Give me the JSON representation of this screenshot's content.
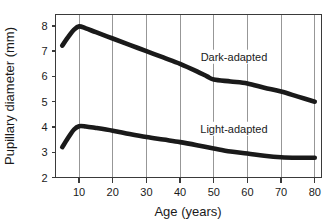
{
  "chart_data": {
    "type": "line",
    "title": "",
    "xlabel": "Age  (years)",
    "ylabel": "Pupillary diameter (mm)",
    "xlim": [
      3,
      82
    ],
    "ylim": [
      2,
      8.45
    ],
    "xticks": [
      10,
      20,
      30,
      40,
      50,
      60,
      70,
      80
    ],
    "yticks": [
      2,
      3,
      4,
      5,
      6,
      7,
      8
    ],
    "xtick_labels": [
      "10",
      "20",
      "30",
      "40",
      "50",
      "60",
      "70",
      "80"
    ],
    "ytick_labels": [
      "2",
      "3",
      "4",
      "5",
      "6",
      "7",
      "8"
    ],
    "grid": "vertical",
    "legend_position": "inline-right",
    "series": [
      {
        "name": "Dark-adapted",
        "label": "Dark-adapted",
        "color": "#1a1a1a",
        "x": [
          5,
          7,
          8.5,
          10,
          12,
          15,
          20,
          25,
          30,
          35,
          40,
          45,
          48,
          50,
          55,
          60,
          65,
          70,
          75,
          80
        ],
        "values": [
          7.22,
          7.6,
          7.85,
          7.98,
          7.9,
          7.75,
          7.5,
          7.25,
          7.0,
          6.75,
          6.5,
          6.2,
          6.0,
          5.88,
          5.8,
          5.72,
          5.55,
          5.4,
          5.2,
          5.0
        ]
      },
      {
        "name": "Light-adapted",
        "label": "Light-adapted",
        "color": "#1a1a1a",
        "x": [
          5,
          7,
          8.5,
          10,
          12,
          15,
          20,
          25,
          30,
          35,
          40,
          45,
          50,
          55,
          60,
          65,
          70,
          75,
          80
        ],
        "values": [
          3.2,
          3.62,
          3.9,
          4.03,
          4.02,
          3.96,
          3.85,
          3.72,
          3.6,
          3.5,
          3.4,
          3.28,
          3.15,
          3.03,
          2.95,
          2.86,
          2.8,
          2.78,
          2.78
        ]
      }
    ],
    "annotations": [
      {
        "text": "Dark-adapted",
        "x": 56,
        "y": 6.7
      },
      {
        "text": "Light-adapted",
        "x": 56,
        "y": 3.85
      }
    ]
  }
}
